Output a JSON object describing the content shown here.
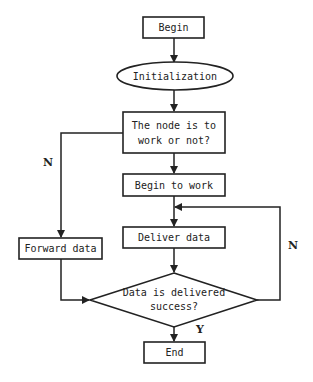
{
  "diagram": {
    "type": "flowchart",
    "colors": {
      "stroke": "#222222",
      "fill": "#ffffff",
      "text": "#222222"
    },
    "nodes": {
      "begin": {
        "shape": "rectangle",
        "label": "Begin"
      },
      "init": {
        "shape": "ellipse",
        "label": "Initialization"
      },
      "decision_work": {
        "shape": "rectangle",
        "line1": "The node is to",
        "line2": "work or not?"
      },
      "begin_work": {
        "shape": "rectangle",
        "label": "Begin to work"
      },
      "deliver": {
        "shape": "rectangle",
        "label": "Deliver data"
      },
      "forward": {
        "shape": "rectangle",
        "label": "Forward data"
      },
      "decision_success": {
        "shape": "diamond",
        "line1": "Data is delivered",
        "line2": "success?"
      },
      "end": {
        "shape": "rectangle",
        "label": "End"
      }
    },
    "edge_labels": {
      "work_no": "N",
      "success_no": "N",
      "success_yes": "Y"
    },
    "edges": [
      {
        "from": "Begin",
        "to": "Initialization"
      },
      {
        "from": "Initialization",
        "to": "The node is to work or not?"
      },
      {
        "from": "The node is to work or not?",
        "to": "Begin to work"
      },
      {
        "from": "The node is to work or not?",
        "to": "Forward data",
        "label": "N"
      },
      {
        "from": "Begin to work",
        "to": "Deliver data"
      },
      {
        "from": "Deliver data",
        "to": "Data is delivered success?"
      },
      {
        "from": "Forward data",
        "to": "Data is delivered success?"
      },
      {
        "from": "Data is delivered success?",
        "to": "Deliver data",
        "label": "N"
      },
      {
        "from": "Data is delivered success?",
        "to": "End",
        "label": "Y"
      }
    ]
  }
}
